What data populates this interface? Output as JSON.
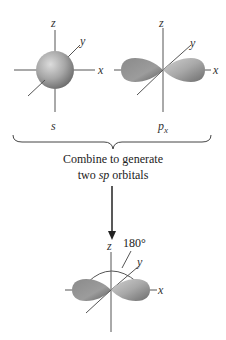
{
  "colors": {
    "orbital_light": "#c8c8c8",
    "orbital_mid": "#9a9a9a",
    "orbital_dark": "#6e6e6e",
    "axis": "#555555",
    "text": "#222222"
  },
  "s_orbital": {
    "axis_labels": {
      "z": "z",
      "y": "y",
      "x": "x"
    },
    "name": "s"
  },
  "p_orbital": {
    "axis_labels": {
      "z": "z",
      "y": "y",
      "x": "x"
    },
    "name_base": "p",
    "name_sub": "x"
  },
  "caption": {
    "line1": "Combine to generate",
    "line2_pre": "two ",
    "line2_italic": "sp",
    "line2_post": " orbitals"
  },
  "sp_orbital": {
    "axis_labels": {
      "z": "z",
      "y": "y",
      "x": "x"
    },
    "angle_label": "180°"
  }
}
